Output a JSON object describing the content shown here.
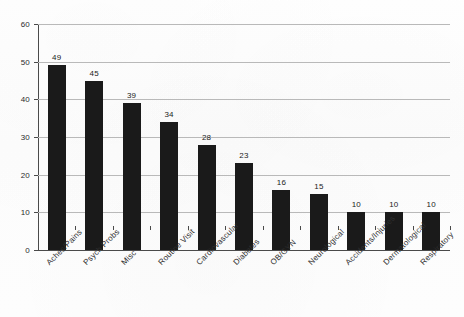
{
  "chart_data": {
    "type": "bar",
    "title": "",
    "subtitle": "",
    "xlabel": "",
    "ylabel": "",
    "ylim": [
      0,
      60
    ],
    "yticks": [
      0,
      10,
      20,
      30,
      40,
      50,
      60
    ],
    "grid": true,
    "legend": false,
    "legend_position": "none",
    "orientation": "vertical",
    "bar_color": "#1a1a1a",
    "gridline_color": "#b9b9b9",
    "axis_color": "#4a4a4a",
    "background_color": "#fdfdfd",
    "categories": [
      "Aches/Pains",
      "Psych Probs",
      "Misc",
      "Routine Visit",
      "Cardiovascular",
      "Diabetes",
      "OB/GYN",
      "Neurological",
      "Accidents/Injuries",
      "Dermatological",
      "Respiratory"
    ],
    "values": [
      49,
      45,
      39,
      34,
      28,
      23,
      16,
      15,
      10,
      10,
      10
    ],
    "data_labels": [
      "49",
      "45",
      "39",
      "34",
      "28",
      "23",
      "16",
      "15",
      "10",
      "10",
      "10"
    ],
    "ytick_labels": [
      "0",
      "10",
      "20",
      "30",
      "40",
      "50",
      "60"
    ]
  }
}
